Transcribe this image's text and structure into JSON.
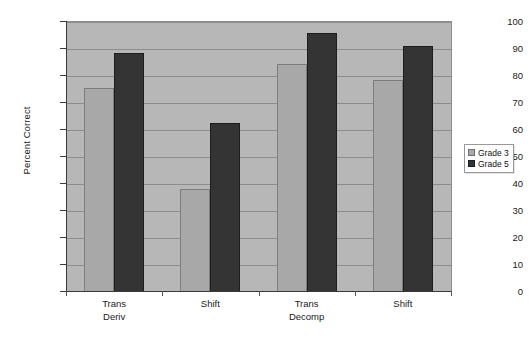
{
  "chart_data": {
    "type": "bar",
    "title": "",
    "xlabel": "",
    "ylabel": "Percent Correct",
    "ylim": [
      0,
      100
    ],
    "ytick_step": 10,
    "yticks": [
      0,
      10,
      20,
      30,
      40,
      50,
      60,
      70,
      80,
      90,
      100
    ],
    "grid": true,
    "legend_position": "right",
    "categories": [
      "Trans Deriv",
      "Shift",
      "Trans Decomp",
      "Shift"
    ],
    "category_lines": [
      [
        "Trans",
        "Deriv"
      ],
      [
        "Shift",
        ""
      ],
      [
        "Trans",
        "Decomp"
      ],
      [
        "Shift",
        ""
      ]
    ],
    "series": [
      {
        "name": "Grade 3",
        "color": "#a8a8a8",
        "values": [
          75.5,
          38,
          84.5,
          78.5
        ]
      },
      {
        "name": "Grade 5",
        "color": "#343434",
        "values": [
          88.5,
          62.5,
          96,
          91
        ]
      }
    ]
  },
  "legend": {
    "items": [
      {
        "label": "Grade 3",
        "color": "#a8a8a8"
      },
      {
        "label": "Grade 5",
        "color": "#343434"
      }
    ]
  },
  "axes": {
    "y_title": "Percent Correct",
    "y_labels": [
      "100",
      "90",
      "80",
      "70",
      "60",
      "50",
      "40",
      "30",
      "20",
      "10",
      "0"
    ]
  },
  "colors": {
    "plot_background": "#b7b7b7",
    "gridline": "#8d8d8d",
    "axis": "#3a3a3a",
    "grade3": "#a8a8a8",
    "grade5": "#343434",
    "page_background": "#ffffff"
  }
}
